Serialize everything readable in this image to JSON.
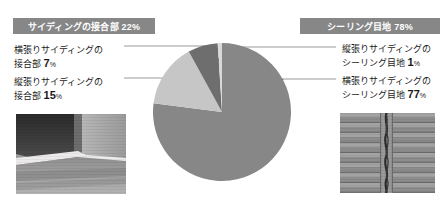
{
  "header": {
    "badges": [
      {
        "name": "siding-joint",
        "text": "サイディングの接合部 22%"
      },
      {
        "name": "sealing-joint",
        "text": "シーリング目地 78%"
      }
    ]
  },
  "labels": {
    "yoko_joint": {
      "line1": "横張りサイディングの",
      "line2": "接合部",
      "value": "7",
      "unit": "%"
    },
    "tate_joint": {
      "line1": "縦張りサイディングの",
      "line2": "接合部",
      "value": "15",
      "unit": "%"
    },
    "tate_seal": {
      "line1": "縦張りサイディングの",
      "line2": "シーリング目地",
      "value": "1",
      "unit": "%"
    },
    "yoko_seal": {
      "line1": "横張りサイディングの",
      "line2": "シーリング目地",
      "value": "77",
      "unit": "%"
    }
  },
  "photos": {
    "left": {
      "alt": "横張りサイディング接合部の写真"
    },
    "right": {
      "alt": "縦張りシーリング目地の写真"
    }
  },
  "colors": {
    "badge_bg": "#878787",
    "badge_text": "#ffffff",
    "slice_main": "#878787",
    "slice_dark": "#6e6e6e",
    "slice_light": "#c6c6c6",
    "slice_pale": "#d9d9d9",
    "leader_line": "#9a9a9a",
    "pointer": "#1a1a1a",
    "text": "#1a1a1a",
    "background": "#ffffff"
  },
  "chart_data": {
    "type": "pie",
    "legend_position": "left-and-right callouts",
    "start_angle_deg": 0,
    "direction": "clockwise",
    "total": 100,
    "unit": "%",
    "categories": [
      "横張りサイディングのシーリング目地",
      "縦張りサイディングの接合部",
      "横張りサイディングの接合部",
      "縦張りサイディングのシーリング目地"
    ],
    "values": [
      77,
      15,
      7,
      1
    ],
    "slices": [
      {
        "label": "横張りサイディングのシーリング目地",
        "value": 77,
        "color": "#878787",
        "group": "シーリング目地"
      },
      {
        "label": "縦張りサイディングの接合部",
        "value": 15,
        "color": "#c6c6c6",
        "group": "サイディングの接合部"
      },
      {
        "label": "横張りサイディングの接合部",
        "value": 7,
        "color": "#6e6e6e",
        "group": "サイディングの接合部"
      },
      {
        "label": "縦張りサイディングのシーリング目地",
        "value": 1,
        "color": "#d9d9d9",
        "group": "シーリング目地"
      }
    ],
    "groups": [
      {
        "label": "サイディングの接合部",
        "value": 22
      },
      {
        "label": "シーリング目地",
        "value": 78
      }
    ]
  }
}
